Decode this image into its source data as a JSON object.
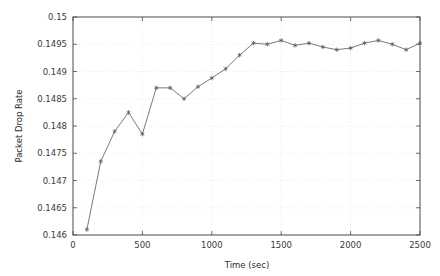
{
  "chart_data": {
    "type": "line",
    "title": "",
    "xlabel": "Time (sec)",
    "ylabel": "Packet Drop Rate",
    "xlim": [
      0,
      2500
    ],
    "ylim": [
      0.146,
      0.15
    ],
    "grid": true,
    "legend": null,
    "marker": "star",
    "line_color": "#6b6b6b",
    "marker_color": "#5a5a5a",
    "grid_color": "#d8d8d8",
    "axis_color": "#4a4a4a",
    "xticks": [
      0,
      500,
      1000,
      1500,
      2000,
      2500
    ],
    "xtick_labels": [
      "0",
      "500",
      "1000",
      "1500",
      "2000",
      "2500"
    ],
    "yticks": [
      0.146,
      0.1465,
      0.147,
      0.1475,
      0.148,
      0.1485,
      0.149,
      0.1495,
      0.15
    ],
    "ytick_labels": [
      "0.146",
      "0.1465",
      "0.147",
      "0.1475",
      "0.148",
      "0.1485",
      "0.149",
      "0.1495",
      "0.15"
    ],
    "x": [
      100,
      200,
      300,
      400,
      500,
      600,
      700,
      800,
      900,
      1000,
      1100,
      1200,
      1300,
      1400,
      1500,
      1600,
      1700,
      1800,
      1900,
      2000,
      2100,
      2200,
      2300,
      2400,
      2500
    ],
    "values": [
      0.1461,
      0.14735,
      0.1479,
      0.14825,
      0.14785,
      0.1487,
      0.1487,
      0.1485,
      0.14872,
      0.14888,
      0.14905,
      0.1493,
      0.14952,
      0.1495,
      0.14957,
      0.14948,
      0.14952,
      0.14945,
      0.1494,
      0.14943,
      0.14952,
      0.14957,
      0.1495,
      0.1494,
      0.14952
    ],
    "series": [
      {
        "name": "Packet Drop Rate",
        "x": [
          100,
          200,
          300,
          400,
          500,
          600,
          700,
          800,
          900,
          1000,
          1100,
          1200,
          1300,
          1400,
          1500,
          1600,
          1700,
          1800,
          1900,
          2000,
          2100,
          2200,
          2300,
          2400,
          2500
        ],
        "values": [
          0.1461,
          0.14735,
          0.1479,
          0.14825,
          0.14785,
          0.1487,
          0.1487,
          0.1485,
          0.14872,
          0.14888,
          0.14905,
          0.1493,
          0.14952,
          0.1495,
          0.14957,
          0.14948,
          0.14952,
          0.14945,
          0.1494,
          0.14943,
          0.14952,
          0.14957,
          0.1495,
          0.1494,
          0.14952
        ]
      }
    ]
  }
}
